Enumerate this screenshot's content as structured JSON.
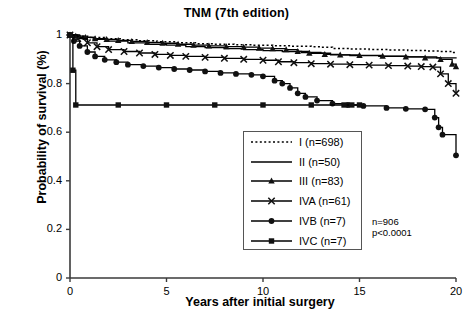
{
  "chart_data": {
    "type": "line",
    "title": "TNM (7th edition)",
    "xlabel": "Years after initial surgery",
    "ylabel": "Probability of survival (%)",
    "xlim": [
      0,
      20
    ],
    "ylim": [
      0,
      1
    ],
    "xticks": [
      "0",
      "5",
      "10",
      "15",
      "20"
    ],
    "xtick_values": [
      0,
      5,
      10,
      15,
      20
    ],
    "yticks": [
      "0",
      "0.2",
      "0.4",
      "0.6",
      "0.8",
      "1"
    ],
    "ytick_values": [
      0,
      0.2,
      0.4,
      0.6,
      0.8,
      1
    ],
    "grid": false,
    "legend_position": "center-right-lower",
    "annotations": [
      "n=906",
      "p<0.0001"
    ],
    "total_n": "n=906",
    "p_value": "p<0.0001",
    "series": [
      {
        "name": "I (n=698)",
        "label": "I",
        "n": 698,
        "style": "dotted",
        "marker": "none",
        "color": "#000000",
        "points": [
          [
            0,
            1.0
          ],
          [
            0.4,
            0.995
          ],
          [
            1.0,
            0.99
          ],
          [
            1.8,
            0.985
          ],
          [
            2.6,
            0.98
          ],
          [
            3.5,
            0.976
          ],
          [
            4.5,
            0.972
          ],
          [
            5.5,
            0.968
          ],
          [
            6.5,
            0.964
          ],
          [
            7.5,
            0.962
          ],
          [
            8.5,
            0.96
          ],
          [
            9.5,
            0.958
          ],
          [
            10.5,
            0.956
          ],
          [
            11.5,
            0.954
          ],
          [
            12.5,
            0.952
          ],
          [
            13.0,
            0.95
          ],
          [
            13.6,
            0.944
          ],
          [
            14.5,
            0.942
          ],
          [
            15.5,
            0.94
          ],
          [
            16.5,
            0.938
          ],
          [
            17.5,
            0.936
          ],
          [
            18.5,
            0.934
          ],
          [
            19.2,
            0.932
          ],
          [
            19.8,
            0.928
          ],
          [
            20,
            0.925
          ]
        ]
      },
      {
        "name": "II (n=50)",
        "label": "II",
        "n": 50,
        "style": "solid",
        "marker": "none",
        "color": "#000000",
        "points": [
          [
            0,
            1.0
          ],
          [
            0.5,
            0.99
          ],
          [
            1.2,
            0.982
          ],
          [
            2.0,
            0.975
          ],
          [
            3.0,
            0.968
          ],
          [
            4.0,
            0.962
          ],
          [
            5.0,
            0.958
          ],
          [
            6.0,
            0.952
          ],
          [
            7.0,
            0.948
          ],
          [
            8.0,
            0.944
          ],
          [
            9.0,
            0.94
          ],
          [
            10.0,
            0.936
          ],
          [
            11.0,
            0.932
          ],
          [
            12.0,
            0.928
          ],
          [
            13.0,
            0.925
          ],
          [
            13.5,
            0.918
          ],
          [
            14.5,
            0.915
          ],
          [
            16.0,
            0.912
          ],
          [
            17.5,
            0.91
          ],
          [
            19.0,
            0.906
          ],
          [
            20,
            0.903
          ]
        ]
      },
      {
        "name": "III (n=83)",
        "label": "III",
        "n": 83,
        "style": "solid",
        "marker": "triangle",
        "color": "#000000",
        "points": [
          [
            0,
            1.0
          ],
          [
            0.3,
            0.995
          ],
          [
            0.8,
            0.99
          ],
          [
            1.3,
            0.985
          ],
          [
            1.9,
            0.982
          ],
          [
            2.5,
            0.978
          ],
          [
            3.2,
            0.974
          ],
          [
            4.0,
            0.97
          ],
          [
            4.8,
            0.966
          ],
          [
            5.6,
            0.962
          ],
          [
            6.4,
            0.958
          ],
          [
            7.2,
            0.955
          ],
          [
            8.1,
            0.952
          ],
          [
            9.0,
            0.95
          ],
          [
            9.8,
            0.946
          ],
          [
            10.5,
            0.944
          ],
          [
            11.2,
            0.94
          ],
          [
            11.8,
            0.932
          ],
          [
            12.4,
            0.925
          ],
          [
            13.2,
            0.92
          ],
          [
            14.0,
            0.918
          ],
          [
            15.0,
            0.916
          ],
          [
            16.2,
            0.913
          ],
          [
            17.4,
            0.91
          ],
          [
            18.4,
            0.906
          ],
          [
            19.2,
            0.9
          ],
          [
            19.8,
            0.88
          ],
          [
            20,
            0.87
          ]
        ]
      },
      {
        "name": "IVA (n=61)",
        "label": "IVA",
        "n": 61,
        "style": "solid",
        "marker": "x",
        "color": "#000000",
        "points": [
          [
            0,
            1.0
          ],
          [
            0.4,
            0.985
          ],
          [
            0.9,
            0.968
          ],
          [
            1.4,
            0.952
          ],
          [
            2.0,
            0.94
          ],
          [
            2.8,
            0.932
          ],
          [
            3.6,
            0.926
          ],
          [
            4.4,
            0.92
          ],
          [
            5.2,
            0.916
          ],
          [
            6.0,
            0.912
          ],
          [
            7.0,
            0.908
          ],
          [
            8.0,
            0.904
          ],
          [
            9.0,
            0.9
          ],
          [
            10.0,
            0.896
          ],
          [
            10.8,
            0.89
          ],
          [
            11.6,
            0.886
          ],
          [
            12.5,
            0.882
          ],
          [
            13.5,
            0.88
          ],
          [
            14.5,
            0.878
          ],
          [
            15.5,
            0.876
          ],
          [
            16.5,
            0.874
          ],
          [
            17.5,
            0.872
          ],
          [
            18.2,
            0.87
          ],
          [
            18.8,
            0.868
          ],
          [
            19.2,
            0.84
          ],
          [
            19.6,
            0.8
          ],
          [
            20,
            0.76
          ]
        ]
      },
      {
        "name": "IVB (n=7)",
        "label": "IVB",
        "n": 7,
        "style": "solid",
        "marker": "circle",
        "color": "#000000",
        "points": [
          [
            0,
            1.0
          ],
          [
            0.2,
            0.975
          ],
          [
            0.5,
            0.955
          ],
          [
            0.9,
            0.93
          ],
          [
            1.3,
            0.912
          ],
          [
            1.8,
            0.898
          ],
          [
            2.4,
            0.888
          ],
          [
            3.0,
            0.878
          ],
          [
            3.8,
            0.872
          ],
          [
            4.6,
            0.866
          ],
          [
            5.4,
            0.86
          ],
          [
            6.2,
            0.856
          ],
          [
            7.0,
            0.85
          ],
          [
            7.8,
            0.844
          ],
          [
            8.6,
            0.84
          ],
          [
            9.4,
            0.836
          ],
          [
            10.0,
            0.83
          ],
          [
            10.6,
            0.812
          ],
          [
            11.0,
            0.8
          ],
          [
            11.4,
            0.782
          ],
          [
            11.8,
            0.76
          ],
          [
            12.2,
            0.745
          ],
          [
            12.8,
            0.73
          ],
          [
            13.6,
            0.718
          ],
          [
            14.4,
            0.712
          ],
          [
            15.2,
            0.708
          ],
          [
            16.4,
            0.7
          ],
          [
            17.4,
            0.696
          ],
          [
            18.4,
            0.694
          ],
          [
            18.9,
            0.66
          ],
          [
            19.1,
            0.62
          ],
          [
            19.3,
            0.59
          ],
          [
            20,
            0.505
          ]
        ]
      },
      {
        "name": "IVC (n=7)",
        "label": "IVC",
        "n": 7,
        "style": "solid",
        "marker": "square",
        "color": "#000000",
        "points": [
          [
            0,
            1.0
          ],
          [
            0.15,
            0.855
          ],
          [
            0.3,
            0.712
          ],
          [
            2.5,
            0.712
          ],
          [
            5.0,
            0.712
          ],
          [
            7.5,
            0.712
          ],
          [
            10.0,
            0.712
          ],
          [
            12.5,
            0.712
          ],
          [
            14.2,
            0.712
          ],
          [
            14.6,
            0.712
          ],
          [
            15.0,
            0.712
          ]
        ]
      }
    ]
  }
}
